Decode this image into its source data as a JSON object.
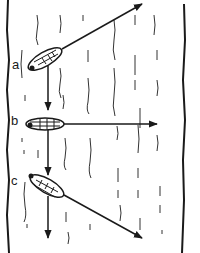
{
  "diagram": {
    "type": "river-crossing-vectors",
    "colors": {
      "ink": "#1a1a1a",
      "background": "#ffffff"
    },
    "boats": [
      {
        "label": "a",
        "heading": "upstream-angled",
        "current_arrow": "down"
      },
      {
        "label": "b",
        "heading": "straight-across",
        "current_arrow": "down"
      },
      {
        "label": "c",
        "heading": "downstream-angled",
        "current_arrow": "down"
      }
    ]
  }
}
